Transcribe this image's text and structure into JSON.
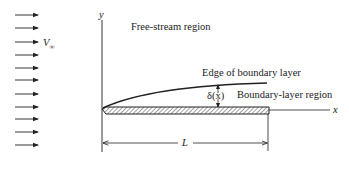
{
  "diagram": {
    "labels": {
      "free_stream_velocity": "V",
      "free_stream_velocity_subscript": "∞",
      "y_axis": "y",
      "x_axis": "x",
      "free_stream_region": "Free-stream region",
      "edge_of_boundary_layer": "Edge of boundary layer",
      "boundary_layer_thickness": "δ(x)",
      "boundary_layer_region": "Boundary-layer region",
      "plate_length": "L"
    },
    "free_stream_arrows": {
      "count": 11,
      "y_positions": [
        15,
        28,
        42,
        55,
        68,
        80,
        94,
        107,
        119,
        132,
        145
      ],
      "x_start": 15,
      "x_end": 38
    },
    "colors": {
      "line": "#222222",
      "background": "#ffffff",
      "hatch": "#444444"
    }
  }
}
